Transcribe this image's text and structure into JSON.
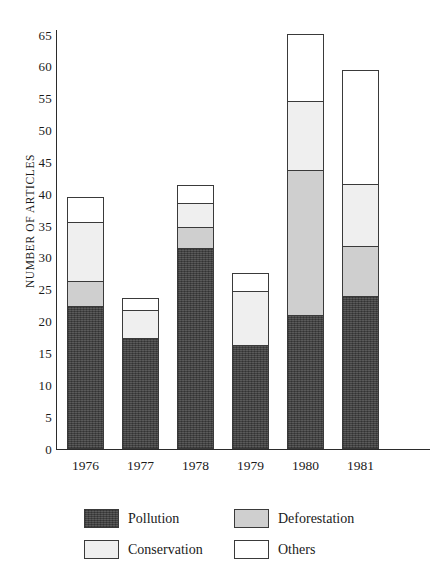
{
  "chart_data": {
    "type": "bar",
    "stacked": true,
    "title": "",
    "xlabel": "",
    "ylabel": "NUMBER  OF ARTICLES",
    "categories": [
      "1976",
      "1977",
      "1978",
      "1979",
      "1980",
      "1981"
    ],
    "ylim": [
      0,
      68
    ],
    "yticks": [
      0,
      5,
      10,
      15,
      20,
      25,
      30,
      35,
      40,
      45,
      50,
      55,
      60,
      65
    ],
    "ytick_labels": [
      "0",
      "5",
      "10",
      "15",
      "20",
      "25",
      "30",
      "35",
      "40",
      "45",
      "50",
      "55",
      "60",
      "65"
    ],
    "grid": false,
    "legend_position": "bottom",
    "series": [
      {
        "name": "Pollution",
        "color": "#4a4a4a",
        "values": [
          22.5,
          17.5,
          31.5,
          16.3,
          21.0,
          24.0
        ]
      },
      {
        "name": "Deforestation",
        "color": "#cfcfcf",
        "values": [
          4.0,
          0.0,
          3.5,
          0.0,
          23.0,
          8.0
        ]
      },
      {
        "name": "Conservation",
        "color": "#efefef",
        "values": [
          9.5,
          4.5,
          4.0,
          8.7,
          11.0,
          10.0
        ]
      },
      {
        "name": "Others",
        "color": "#ffffff",
        "values": [
          4.0,
          2.0,
          3.0,
          3.0,
          10.6,
          18.0
        ]
      }
    ],
    "totals": [
      40.0,
      24.0,
      42.0,
      28.0,
      65.6,
      60.0
    ]
  },
  "legend": {
    "items": [
      {
        "label": "Pollution"
      },
      {
        "label": "Deforestation"
      },
      {
        "label": "Conservation"
      },
      {
        "label": "Others"
      }
    ]
  }
}
